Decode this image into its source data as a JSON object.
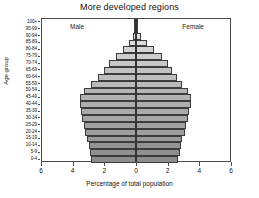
{
  "chart_data": {
    "type": "bar",
    "title": "More developed regions",
    "xlabel": "Percentage of total population",
    "ylabel": "Age group",
    "orientation": "population-pyramid",
    "xlim": [
      -6,
      6
    ],
    "xticks": [
      6,
      4,
      2,
      0,
      2,
      4,
      6
    ],
    "xtick_values": [
      -6,
      -4,
      -2,
      0,
      2,
      4,
      6
    ],
    "grid": false,
    "legend_position": "inside-top",
    "annotations": [
      "Male",
      "Female"
    ],
    "categories": [
      "0-4",
      "5-9",
      "10-14",
      "15-19",
      "20-24",
      "25-29",
      "30-34",
      "35-39",
      "40-44",
      "45-49",
      "50-54",
      "55-59",
      "60-64",
      "65-69",
      "70-74",
      "75-79",
      "80-84",
      "85-89",
      "90-94",
      "95-99",
      "100+"
    ],
    "series": [
      {
        "name": "Male",
        "side": "left",
        "values": [
          2.85,
          2.95,
          3.0,
          3.1,
          3.25,
          3.35,
          3.45,
          3.5,
          3.6,
          3.55,
          3.3,
          2.85,
          2.45,
          2.05,
          1.7,
          1.25,
          0.8,
          0.42,
          0.18,
          0.05,
          0.012
        ]
      },
      {
        "name": "Female",
        "side": "right",
        "values": [
          2.7,
          2.8,
          2.85,
          2.95,
          3.1,
          3.2,
          3.35,
          3.4,
          3.5,
          3.5,
          3.3,
          2.95,
          2.6,
          2.3,
          2.05,
          1.65,
          1.15,
          0.68,
          0.32,
          0.1,
          0.025
        ]
      }
    ],
    "band_colors": [
      "#8c8c8c",
      "#8f8f8f",
      "#939393",
      "#9a9a9a",
      "#9e9e9e",
      "#a2a2a2",
      "#a6a6a6",
      "#aaaaaa",
      "#aeaeae",
      "#b2b2b2",
      "#b6b6b6",
      "#bababa",
      "#bebebe",
      "#c2c2c2",
      "#c8c8c8",
      "#cecece",
      "#d4d4d4",
      "#dadada",
      "#e0e0e0",
      "#e6e6e6",
      "#3a3a3a"
    ],
    "colors": {
      "frame": "#4a4a4a",
      "center_line": "#2b2b2b",
      "bar_border": "#3c3c3c",
      "background": "#ffffff",
      "text": "#111111"
    }
  },
  "labels": {
    "male": "Male",
    "female": "Female"
  }
}
